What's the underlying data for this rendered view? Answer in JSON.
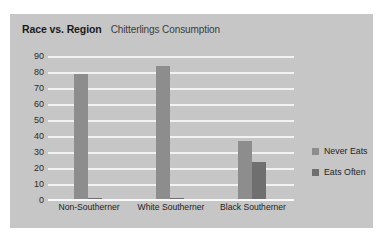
{
  "chart_data": {
    "type": "bar",
    "title": "Race vs. Region",
    "subtitle": "Chitterlings Consumption",
    "xlabel": "",
    "ylabel": "",
    "ylim": [
      0,
      90
    ],
    "yticks": [
      90,
      80,
      70,
      60,
      50,
      40,
      30,
      20,
      10,
      0
    ],
    "grid": true,
    "legend_position": "right",
    "categories": [
      "Non-Southerner",
      "White Southerner",
      "Black Southerner"
    ],
    "series": [
      {
        "name": "Never Eats",
        "color": "#8d8d8d",
        "values": [
          79,
          84,
          37
        ]
      },
      {
        "name": "Eats Often",
        "color": "#6f6f6f",
        "values": [
          1,
          1,
          24
        ]
      }
    ]
  },
  "panel": {
    "background": "#c6c6c6",
    "gridline_color": "#f2f2f2"
  }
}
